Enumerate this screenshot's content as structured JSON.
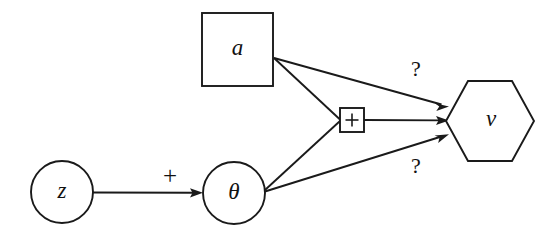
{
  "diagram": {
    "type": "directed-graph",
    "title": "",
    "background_color": "#ffffff",
    "stroke_color": "#1a1a1a",
    "nodes": [
      {
        "id": "z",
        "label": "z",
        "shape": "circle",
        "cx": 62,
        "cy": 192,
        "r": 31
      },
      {
        "id": "theta",
        "label": "θ",
        "shape": "circle",
        "cx": 234,
        "cy": 193,
        "r": 31
      },
      {
        "id": "a",
        "label": "a",
        "shape": "square",
        "x": 202,
        "y": 13,
        "width": 71,
        "height": 73
      },
      {
        "id": "plus",
        "label": "+",
        "shape": "small-square-operator",
        "x": 340,
        "y": 108,
        "width": 24,
        "height": 24
      },
      {
        "id": "v",
        "label": "v",
        "shape": "hexagon",
        "cx": 490,
        "cy": 121,
        "rx": 44,
        "ry": 41
      }
    ],
    "edges": [
      {
        "id": "z-to-theta",
        "from": "z",
        "to": "theta",
        "label": "+",
        "label_x": 170,
        "label_y": 178,
        "arrowhead": true
      },
      {
        "id": "a-to-v",
        "from": "a",
        "to": "v",
        "label": "?",
        "label_x": 416,
        "label_y": 71,
        "arrowhead": true
      },
      {
        "id": "a-to-plus",
        "from": "a",
        "to": "plus",
        "label": "",
        "arrowhead": false
      },
      {
        "id": "theta-to-plus",
        "from": "theta",
        "to": "plus",
        "label": "",
        "arrowhead": false
      },
      {
        "id": "plus-to-v",
        "from": "plus",
        "to": "v",
        "label": "",
        "arrowhead": true
      },
      {
        "id": "theta-to-v",
        "from": "theta",
        "to": "v",
        "label": "?",
        "label_x": 416,
        "label_y": 168,
        "arrowhead": true
      }
    ]
  }
}
